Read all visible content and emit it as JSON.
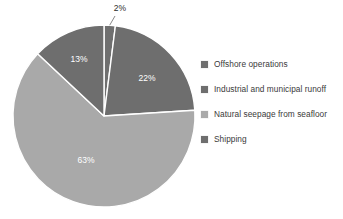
{
  "chart_data": {
    "type": "pie",
    "title": "",
    "subtitle": "",
    "xlabel": "",
    "ylabel": "",
    "grid": false,
    "legend_position": "right",
    "start_angle_deg": 0,
    "direction": "clockwise",
    "categories": [
      "Offshore operations",
      "Industrial and municipal runoff",
      "Natural seepage from seafloor",
      "Shipping"
    ],
    "values": [
      2,
      22,
      63,
      13
    ],
    "value_unit": "%",
    "data_labels": [
      "2%",
      "22%",
      "63%",
      "13%"
    ],
    "colors": [
      "#6f6f6f",
      "#6e6e6e",
      "#a9a9a9",
      "#6e6e6e"
    ],
    "slice_separator_color": "#ffffff",
    "annotations": [
      {
        "text": "2%",
        "placement": "outside-top",
        "leader_line": true
      }
    ]
  },
  "pie": {
    "center_x": 104,
    "center_y": 116,
    "radius": 91,
    "slices": [
      {
        "label": "2%",
        "value": 2,
        "color": "#6f6f6f",
        "label_color": "#2b2b2b",
        "label_x": 120,
        "label_y": 11,
        "outside": true
      },
      {
        "label": "22%",
        "value": 22,
        "color": "#6e6e6e",
        "label_color": "#ffffff",
        "label_x": 147,
        "label_y": 81,
        "outside": false
      },
      {
        "label": "63%",
        "value": 63,
        "color": "#a9a9a9",
        "label_color": "#ffffff",
        "label_x": 86,
        "label_y": 163,
        "outside": false
      },
      {
        "label": "13%",
        "value": 13,
        "color": "#6e6e6e",
        "label_color": "#ffffff",
        "label_x": 79,
        "label_y": 62,
        "outside": false
      }
    ]
  },
  "legend": {
    "items": [
      {
        "label": "Offshore operations",
        "color": "#6f6f6f"
      },
      {
        "label": "Industrial and municipal runoff",
        "color": "#6e6e6e"
      },
      {
        "label": "Natural seepage from seafloor",
        "color": "#a9a9a9"
      },
      {
        "label": "Shipping",
        "color": "#6e6e6e"
      }
    ]
  }
}
